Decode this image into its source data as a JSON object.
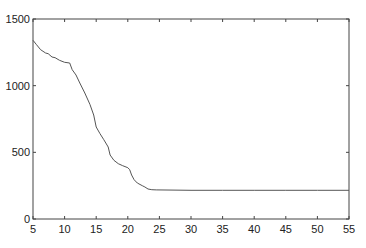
{
  "chart_data": {
    "type": "line",
    "title": "",
    "xlabel": "",
    "ylabel": "",
    "xlim": [
      5,
      55
    ],
    "ylim": [
      0,
      1500
    ],
    "grid": false,
    "legend": null,
    "x_ticks": [
      5,
      10,
      15,
      20,
      25,
      30,
      35,
      40,
      45,
      50,
      55
    ],
    "y_ticks": [
      0,
      500,
      1000,
      1500
    ],
    "x_tick_labels": [
      "5",
      "10",
      "15",
      "20",
      "25",
      "30",
      "35",
      "40",
      "45",
      "50",
      "55"
    ],
    "y_tick_labels": [
      "0",
      "500",
      "1000",
      "1500"
    ],
    "series": [
      {
        "name": "series-1",
        "color": "#555555",
        "x": [
          5,
          5.5,
          6.2,
          7.0,
          7.4,
          8.0,
          8.5,
          9.2,
          10.0,
          10.8,
          11.2,
          11.8,
          12.4,
          13.2,
          14.0,
          14.6,
          15.0,
          15.6,
          16.2,
          16.9,
          17.2,
          17.8,
          18.5,
          19.2,
          20.0,
          20.3,
          20.6,
          21.0,
          21.5,
          22.3,
          22.7,
          23.2,
          23.8,
          24.5,
          30,
          35,
          40,
          45,
          50,
          55
        ],
        "y": [
          1340,
          1310,
          1270,
          1245,
          1240,
          1215,
          1210,
          1190,
          1175,
          1170,
          1120,
          1080,
          1020,
          945,
          860,
          780,
          690,
          640,
          595,
          540,
          480,
          440,
          415,
          400,
          385,
          370,
          330,
          295,
          270,
          250,
          240,
          225,
          220,
          218,
          215,
          215,
          215,
          215,
          215,
          215
        ]
      }
    ]
  }
}
